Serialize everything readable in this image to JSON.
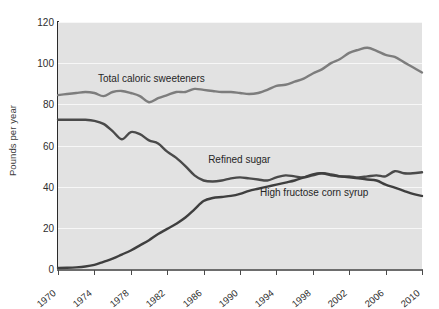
{
  "chart_data": {
    "type": "line",
    "title": "",
    "xlabel": "",
    "ylabel": "Pounds per year",
    "xlim": [
      1970,
      2010
    ],
    "ylim": [
      0,
      120
    ],
    "grid": true,
    "legend_position": "inline-annotations",
    "xticks": [
      "1970",
      "1974",
      "1978",
      "1982",
      "1986",
      "1990",
      "1994",
      "1998",
      "2002",
      "2006",
      "2010"
    ],
    "yticks": [
      "0",
      "20",
      "40",
      "60",
      "80",
      "100",
      "120"
    ],
    "x": [
      1970,
      1971,
      1972,
      1973,
      1974,
      1975,
      1976,
      1977,
      1978,
      1979,
      1980,
      1981,
      1982,
      1983,
      1984,
      1985,
      1986,
      1987,
      1988,
      1989,
      1990,
      1991,
      1992,
      1993,
      1994,
      1995,
      1996,
      1997,
      1998,
      1999,
      2000,
      2001,
      2002,
      2003,
      2004,
      2005,
      2006,
      2007,
      2008,
      2009,
      2010
    ],
    "series": [
      {
        "name": "Total caloric sweeteners",
        "color": "#7d7d7d",
        "label_x": 1974.4,
        "label_y": 95,
        "values": [
          84.5,
          85.0,
          85.5,
          86.0,
          85.5,
          84.0,
          86.0,
          86.5,
          85.5,
          84.0,
          81.0,
          83.0,
          84.5,
          86.0,
          86.0,
          87.5,
          87.0,
          86.5,
          86.0,
          86.0,
          85.5,
          85.0,
          85.5,
          87.0,
          89.0,
          89.5,
          91.0,
          92.5,
          95.0,
          97.0,
          100.0,
          102.0,
          105.0,
          106.5,
          107.5,
          106.0,
          104.0,
          103.0,
          100.5,
          98.0,
          95.5
        ]
      },
      {
        "name": "Refined sugar",
        "color": "#4a4a4a",
        "label_x": 1986.5,
        "label_y": 56,
        "values": [
          72.5,
          72.5,
          72.5,
          72.5,
          72.0,
          70.5,
          67.0,
          63.0,
          66.5,
          65.5,
          62.5,
          61.0,
          57.0,
          54.0,
          50.0,
          45.5,
          43.0,
          42.5,
          43.0,
          44.0,
          44.5,
          44.0,
          43.5,
          43.0,
          44.5,
          45.5,
          45.0,
          44.5,
          45.5,
          46.5,
          46.0,
          45.0,
          45.0,
          44.5,
          45.0,
          45.5,
          45.0,
          47.5,
          46.5,
          46.5,
          47.0
        ]
      },
      {
        "name": "High fructose corn syrup",
        "color": "#3f3f3f",
        "label_x": 1992.2,
        "label_y": 40,
        "values": [
          0.5,
          0.6,
          0.8,
          1.2,
          2.0,
          3.5,
          5.0,
          7.0,
          9.0,
          11.5,
          14.0,
          17.0,
          19.5,
          22.0,
          25.0,
          29.0,
          33.0,
          34.5,
          35.0,
          35.5,
          36.5,
          38.0,
          39.0,
          40.0,
          41.0,
          42.0,
          43.0,
          44.5,
          46.0,
          46.5,
          45.5,
          45.0,
          44.5,
          44.0,
          43.5,
          43.0,
          41.0,
          39.5,
          38.0,
          36.5,
          35.5
        ]
      }
    ]
  }
}
